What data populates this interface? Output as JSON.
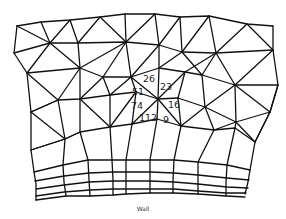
{
  "diagram": {
    "type": "triangular-to-quad mesh near wall",
    "caption": "Wall",
    "cell_labels": [
      {
        "text": "26",
        "x": 149,
        "y": 79
      },
      {
        "text": "23",
        "x": 166,
        "y": 87
      },
      {
        "text": "51",
        "x": 138,
        "y": 92
      },
      {
        "text": "74",
        "x": 137,
        "y": 106
      },
      {
        "text": "16",
        "x": 174,
        "y": 105
      },
      {
        "text": "112",
        "x": 148,
        "y": 118
      },
      {
        "text": "9",
        "x": 166,
        "y": 120
      }
    ]
  }
}
